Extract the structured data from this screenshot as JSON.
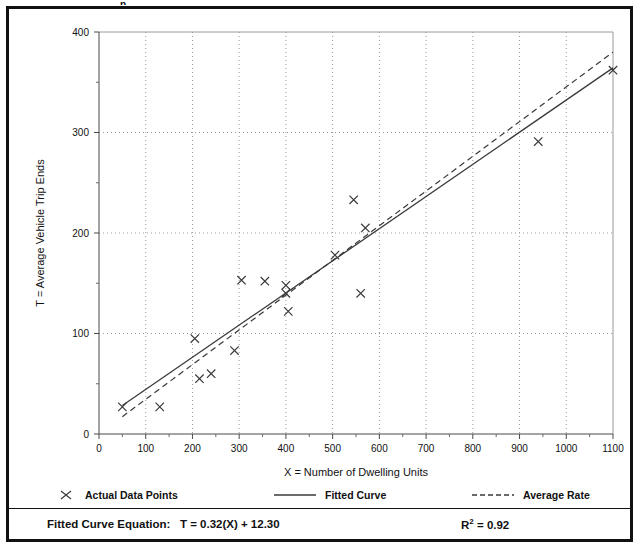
{
  "chart_data": {
    "type": "scatter",
    "title": "",
    "xlabel": "X = Number of Dwelling Units",
    "ylabel": "T = Average Vehicle Trip Ends",
    "xlim": [
      0,
      1100
    ],
    "ylim": [
      0,
      400
    ],
    "xticks": [
      0,
      100,
      200,
      300,
      400,
      500,
      600,
      700,
      800,
      900,
      1000,
      1100
    ],
    "yticks": [
      0,
      100,
      200,
      300,
      400
    ],
    "xtick_labels": [
      "0",
      "100",
      "200",
      "300",
      "400",
      "500",
      "600",
      "700",
      "800",
      "900",
      "1000",
      "1100"
    ],
    "ytick_labels": [
      "0",
      "100",
      "200",
      "300",
      "400"
    ],
    "xminor_step": 50,
    "yminor_step": 50,
    "grid": true,
    "grid_style": "dotted",
    "legend_position": "below-axes",
    "series": [
      {
        "name": "Actual Data Points",
        "type": "scatter",
        "marker": "x",
        "points": [
          [
            50,
            27
          ],
          [
            130,
            27
          ],
          [
            205,
            95
          ],
          [
            215,
            55
          ],
          [
            240,
            60
          ],
          [
            290,
            83
          ],
          [
            305,
            153
          ],
          [
            355,
            152
          ],
          [
            400,
            148
          ],
          [
            400,
            140
          ],
          [
            405,
            122
          ],
          [
            505,
            178
          ],
          [
            545,
            233
          ],
          [
            560,
            140
          ],
          [
            570,
            205
          ],
          [
            940,
            291
          ],
          [
            1100,
            362
          ]
        ]
      },
      {
        "name": "Fitted Curve",
        "type": "line",
        "style": "solid",
        "equation": "T = 0.32(X) + 12.30",
        "slope": 0.32,
        "intercept": 12.3,
        "x_range": [
          50,
          1100
        ]
      },
      {
        "name": "Average Rate",
        "type": "line",
        "style": "dashed",
        "slope": 0.3454,
        "intercept": 0.0,
        "x_range": [
          50,
          1100
        ]
      }
    ]
  },
  "legend": {
    "items": [
      {
        "label": "Actual Data Points",
        "symbol": "x-marker"
      },
      {
        "label": "Fitted Curve",
        "symbol": "solid-line"
      },
      {
        "label": "Average Rate",
        "symbol": "dashed-line"
      }
    ]
  },
  "footer": {
    "equation_label": "Fitted Curve Equation:",
    "equation_value": "T = 0.32(X) + 12.30",
    "r2_label": "R",
    "r2_exponent": "2",
    "r2_value": "= 0.92"
  },
  "top_fragment": "p"
}
